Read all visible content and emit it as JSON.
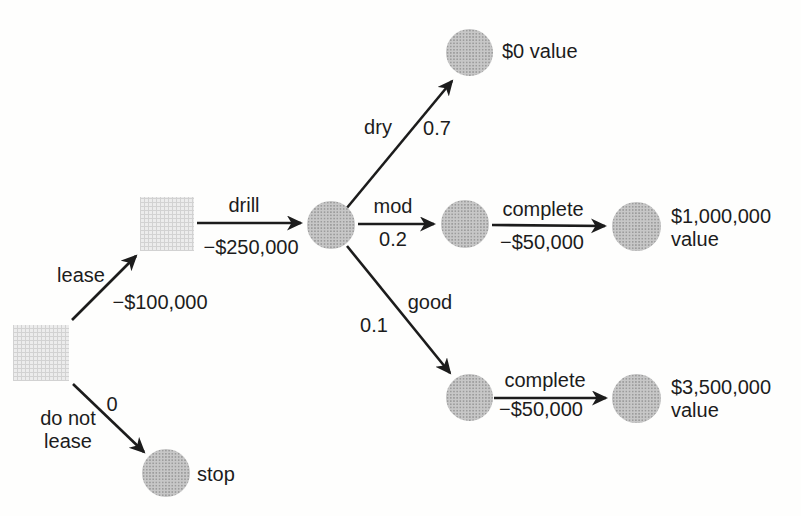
{
  "diagram": {
    "type": "decision-tree",
    "background_color": "#fdfdfa",
    "line_color": "#1c1c1c",
    "decision_node_color": "#ececec",
    "chance_node_color": "#c7c7c7"
  },
  "nodes": [
    {
      "id": "decision-root",
      "type": "decision",
      "x": 41,
      "y": 353,
      "size": 56
    },
    {
      "id": "decision-drill",
      "type": "decision",
      "x": 167,
      "y": 224,
      "size": 54
    },
    {
      "id": "chance-drill-outcome",
      "type": "chance",
      "x": 331,
      "y": 225,
      "size": 48
    },
    {
      "id": "terminal-dry",
      "type": "chance",
      "x": 469,
      "y": 52,
      "size": 47
    },
    {
      "id": "chance-mod",
      "type": "chance",
      "x": 465,
      "y": 224,
      "size": 48
    },
    {
      "id": "terminal-mod",
      "type": "chance",
      "x": 636,
      "y": 226,
      "size": 49
    },
    {
      "id": "chance-good",
      "type": "chance",
      "x": 469,
      "y": 397,
      "size": 47
    },
    {
      "id": "terminal-good",
      "type": "chance",
      "x": 636,
      "y": 398,
      "size": 49
    },
    {
      "id": "terminal-stop",
      "type": "chance",
      "x": 166,
      "y": 473,
      "size": 48
    }
  ],
  "edges": [
    {
      "id": "lease",
      "x1": 72,
      "y1": 320,
      "x2": 136,
      "y2": 256
    },
    {
      "id": "do-not-lease",
      "x1": 73,
      "y1": 384,
      "x2": 144,
      "y2": 452
    },
    {
      "id": "drill",
      "x1": 197,
      "y1": 223,
      "x2": 301,
      "y2": 223
    },
    {
      "id": "dry",
      "x1": 346,
      "y1": 209,
      "x2": 452,
      "y2": 81
    },
    {
      "id": "mod",
      "x1": 358,
      "y1": 224,
      "x2": 434,
      "y2": 224
    },
    {
      "id": "good",
      "x1": 347,
      "y1": 246,
      "x2": 450,
      "y2": 373
    },
    {
      "id": "complete-mod",
      "x1": 492,
      "y1": 225,
      "x2": 605,
      "y2": 226
    },
    {
      "id": "complete-good",
      "x1": 494,
      "y1": 398,
      "x2": 606,
      "y2": 398
    }
  ],
  "labels": [
    {
      "id": "lease-action",
      "lines": [
        "lease"
      ],
      "x": 81,
      "y": 275,
      "align": "center"
    },
    {
      "id": "lease-cost",
      "lines": [
        "−$100,000"
      ],
      "x": 160,
      "y": 302,
      "align": "center"
    },
    {
      "id": "do-not-lease-value",
      "lines": [
        "0"
      ],
      "x": 112,
      "y": 404,
      "align": "center"
    },
    {
      "id": "do-not-lease-action",
      "lines": [
        "do not",
        "lease"
      ],
      "x": 68,
      "y": 430,
      "align": "center"
    },
    {
      "id": "stop-outcome",
      "lines": [
        "stop"
      ],
      "x": 197,
      "y": 474,
      "align": "left"
    },
    {
      "id": "drill-action",
      "lines": [
        "drill"
      ],
      "x": 244,
      "y": 205,
      "align": "center"
    },
    {
      "id": "drill-cost",
      "lines": [
        "−$250,000"
      ],
      "x": 251,
      "y": 247,
      "align": "center"
    },
    {
      "id": "dry-outcome",
      "lines": [
        "dry"
      ],
      "x": 378,
      "y": 127,
      "align": "center"
    },
    {
      "id": "dry-probability",
      "lines": [
        "0.7"
      ],
      "x": 437,
      "y": 128,
      "align": "center"
    },
    {
      "id": "dry-value",
      "lines": [
        "$0 value"
      ],
      "x": 502,
      "y": 51,
      "align": "left"
    },
    {
      "id": "mod-outcome",
      "lines": [
        "mod"
      ],
      "x": 393,
      "y": 206,
      "align": "center"
    },
    {
      "id": "mod-probability",
      "lines": [
        "0.2"
      ],
      "x": 393,
      "y": 239,
      "align": "center"
    },
    {
      "id": "complete-mod-action",
      "lines": [
        "complete"
      ],
      "x": 543,
      "y": 209,
      "align": "center"
    },
    {
      "id": "complete-mod-cost",
      "lines": [
        "−$50,000"
      ],
      "x": 542,
      "y": 242,
      "align": "center"
    },
    {
      "id": "mod-value",
      "lines": [
        "$1,000,000",
        "value"
      ],
      "x": 671,
      "y": 228,
      "align": "left"
    },
    {
      "id": "good-outcome",
      "lines": [
        "good"
      ],
      "x": 430,
      "y": 302,
      "align": "center"
    },
    {
      "id": "good-probability",
      "lines": [
        "0.1"
      ],
      "x": 374,
      "y": 325,
      "align": "center"
    },
    {
      "id": "complete-good-action",
      "lines": [
        "complete"
      ],
      "x": 545,
      "y": 380,
      "align": "center"
    },
    {
      "id": "complete-good-cost",
      "lines": [
        "−$50,000"
      ],
      "x": 541,
      "y": 409,
      "align": "center"
    },
    {
      "id": "good-value",
      "lines": [
        "$3,500,000",
        "value"
      ],
      "x": 671,
      "y": 399,
      "align": "left"
    }
  ]
}
